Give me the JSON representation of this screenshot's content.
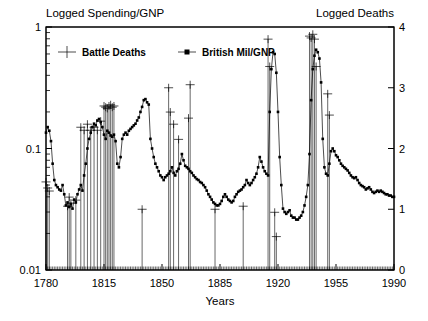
{
  "chart_data": {
    "type": "line",
    "title": "",
    "left_axis": {
      "label": "Logged Spending/GNP",
      "scale": "log",
      "ticks": [
        "1",
        "0.1",
        "0.01"
      ],
      "tickvals": [
        1,
        0.1,
        0.01
      ],
      "ylim": [
        0.01,
        1
      ]
    },
    "right_axis": {
      "label": "Logged Deaths",
      "scale": "linear",
      "ticks": [
        "4",
        "3",
        "2",
        "1",
        "0"
      ],
      "tickvals": [
        4,
        3,
        2,
        1,
        0
      ],
      "ylim": [
        0,
        4
      ]
    },
    "xlabel": "Years",
    "xticks": [
      "1780",
      "1815",
      "1850",
      "1885",
      "1920",
      "1955",
      "1990"
    ],
    "xtickvals": [
      1780,
      1815,
      1850,
      1885,
      1920,
      1955,
      1990
    ],
    "xlim": [
      1780,
      1990
    ],
    "grid": false,
    "legend_position": "top-left-inside",
    "series": [
      {
        "name": "Battle Deaths",
        "axis": "right",
        "marker": "plus",
        "style": "spikes",
        "points": [
          [
            1780,
            1.45
          ],
          [
            1781,
            1.35
          ],
          [
            1782,
            1.3
          ],
          [
            1793,
            1.05
          ],
          [
            1794,
            1.2
          ],
          [
            1795,
            1.1
          ],
          [
            1798,
            1.15
          ],
          [
            1801,
            2.35
          ],
          [
            1803,
            2.3
          ],
          [
            1805,
            2.4
          ],
          [
            1807,
            2.3
          ],
          [
            1809,
            2.35
          ],
          [
            1811,
            2.3
          ],
          [
            1813,
            2.45
          ],
          [
            1815,
            2.7
          ],
          [
            1816,
            2.68
          ],
          [
            1817,
            2.66
          ],
          [
            1818,
            2.7
          ],
          [
            1819,
            2.72
          ],
          [
            1820,
            2.68
          ],
          [
            1821,
            2.7
          ],
          [
            1838,
            1.0
          ],
          [
            1854,
            3.0
          ],
          [
            1855,
            2.6
          ],
          [
            1857,
            2.4
          ],
          [
            1860,
            2.15
          ],
          [
            1866,
            2.5
          ],
          [
            1867,
            3.05
          ],
          [
            1882,
            1.0
          ],
          [
            1899,
            1.05
          ],
          [
            1914,
            3.8
          ],
          [
            1915,
            3.35
          ],
          [
            1918,
            0.95
          ],
          [
            1919,
            0.55
          ],
          [
            1939,
            3.85
          ],
          [
            1940,
            3.82
          ],
          [
            1941,
            3.88
          ],
          [
            1942,
            3.8
          ],
          [
            1943,
            3.35
          ],
          [
            1950,
            2.9
          ],
          [
            1951,
            2.55
          ]
        ]
      },
      {
        "name": "British Mil/GNP",
        "axis": "left",
        "marker": "dot",
        "style": "continuous",
        "points": [
          [
            1780,
            0.135
          ],
          [
            1781,
            0.15
          ],
          [
            1782,
            0.14
          ],
          [
            1783,
            0.115
          ],
          [
            1784,
            0.075
          ],
          [
            1785,
            0.055
          ],
          [
            1786,
            0.05
          ],
          [
            1787,
            0.048
          ],
          [
            1788,
            0.046
          ],
          [
            1789,
            0.045
          ],
          [
            1790,
            0.05
          ],
          [
            1791,
            0.042
          ],
          [
            1792,
            0.034
          ],
          [
            1793,
            0.036
          ],
          [
            1794,
            0.033
          ],
          [
            1795,
            0.035
          ],
          [
            1796,
            0.032
          ],
          [
            1797,
            0.038
          ],
          [
            1798,
            0.036
          ],
          [
            1799,
            0.042
          ],
          [
            1800,
            0.046
          ],
          [
            1801,
            0.05
          ],
          [
            1802,
            0.045
          ],
          [
            1803,
            0.06
          ],
          [
            1804,
            0.075
          ],
          [
            1805,
            0.1
          ],
          [
            1806,
            0.12
          ],
          [
            1807,
            0.135
          ],
          [
            1808,
            0.15
          ],
          [
            1809,
            0.16
          ],
          [
            1810,
            0.155
          ],
          [
            1811,
            0.17
          ],
          [
            1812,
            0.175
          ],
          [
            1813,
            0.165
          ],
          [
            1814,
            0.15
          ],
          [
            1815,
            0.13
          ],
          [
            1816,
            0.12
          ],
          [
            1817,
            0.14
          ],
          [
            1818,
            0.135
          ],
          [
            1819,
            0.128
          ],
          [
            1820,
            0.125
          ],
          [
            1821,
            0.13
          ],
          [
            1822,
            0.115
          ],
          [
            1823,
            0.075
          ],
          [
            1824,
            0.07
          ],
          [
            1825,
            0.085
          ],
          [
            1826,
            0.12
          ],
          [
            1827,
            0.13
          ],
          [
            1828,
            0.135
          ],
          [
            1829,
            0.13
          ],
          [
            1830,
            0.14
          ],
          [
            1831,
            0.145
          ],
          [
            1832,
            0.15
          ],
          [
            1833,
            0.155
          ],
          [
            1834,
            0.16
          ],
          [
            1835,
            0.17
          ],
          [
            1836,
            0.18
          ],
          [
            1837,
            0.2
          ],
          [
            1838,
            0.22
          ],
          [
            1839,
            0.25
          ],
          [
            1840,
            0.255
          ],
          [
            1841,
            0.24
          ],
          [
            1842,
            0.23
          ],
          [
            1843,
            0.12
          ],
          [
            1844,
            0.1
          ],
          [
            1845,
            0.085
          ],
          [
            1846,
            0.075
          ],
          [
            1847,
            0.07
          ],
          [
            1848,
            0.065
          ],
          [
            1849,
            0.06
          ],
          [
            1850,
            0.058
          ],
          [
            1851,
            0.055
          ],
          [
            1852,
            0.058
          ],
          [
            1853,
            0.06
          ],
          [
            1854,
            0.062
          ],
          [
            1855,
            0.065
          ],
          [
            1856,
            0.07
          ],
          [
            1857,
            0.063
          ],
          [
            1858,
            0.06
          ],
          [
            1859,
            0.065
          ],
          [
            1860,
            0.068
          ],
          [
            1861,
            0.075
          ],
          [
            1862,
            0.09
          ],
          [
            1863,
            0.08
          ],
          [
            1864,
            0.072
          ],
          [
            1865,
            0.07
          ],
          [
            1866,
            0.068
          ],
          [
            1867,
            0.065
          ],
          [
            1868,
            0.063
          ],
          [
            1869,
            0.06
          ],
          [
            1870,
            0.058
          ],
          [
            1871,
            0.056
          ],
          [
            1872,
            0.055
          ],
          [
            1873,
            0.053
          ],
          [
            1874,
            0.052
          ],
          [
            1875,
            0.05
          ],
          [
            1876,
            0.048
          ],
          [
            1877,
            0.045
          ],
          [
            1878,
            0.042
          ],
          [
            1879,
            0.04
          ],
          [
            1880,
            0.038
          ],
          [
            1881,
            0.036
          ],
          [
            1882,
            0.035
          ],
          [
            1883,
            0.034
          ],
          [
            1884,
            0.034
          ],
          [
            1885,
            0.035
          ],
          [
            1886,
            0.037
          ],
          [
            1887,
            0.04
          ],
          [
            1888,
            0.042
          ],
          [
            1889,
            0.04
          ],
          [
            1890,
            0.038
          ],
          [
            1891,
            0.037
          ],
          [
            1892,
            0.036
          ],
          [
            1893,
            0.037
          ],
          [
            1894,
            0.04
          ],
          [
            1895,
            0.042
          ],
          [
            1896,
            0.044
          ],
          [
            1897,
            0.045
          ],
          [
            1898,
            0.046
          ],
          [
            1899,
            0.048
          ],
          [
            1900,
            0.05
          ],
          [
            1901,
            0.055
          ],
          [
            1902,
            0.052
          ],
          [
            1903,
            0.05
          ],
          [
            1904,
            0.052
          ],
          [
            1905,
            0.055
          ],
          [
            1906,
            0.058
          ],
          [
            1907,
            0.062
          ],
          [
            1908,
            0.07
          ],
          [
            1909,
            0.085
          ],
          [
            1910,
            0.078
          ],
          [
            1911,
            0.07
          ],
          [
            1912,
            0.065
          ],
          [
            1913,
            0.062
          ],
          [
            1914,
            0.06
          ],
          [
            1915,
            0.2
          ],
          [
            1916,
            0.45
          ],
          [
            1917,
            0.62
          ],
          [
            1918,
            0.6
          ],
          [
            1919,
            0.42
          ],
          [
            1920,
            0.2
          ],
          [
            1921,
            0.085
          ],
          [
            1922,
            0.05
          ],
          [
            1923,
            0.032
          ],
          [
            1924,
            0.03
          ],
          [
            1925,
            0.029
          ],
          [
            1926,
            0.03
          ],
          [
            1927,
            0.031
          ],
          [
            1928,
            0.028
          ],
          [
            1929,
            0.027
          ],
          [
            1930,
            0.027
          ],
          [
            1931,
            0.026
          ],
          [
            1932,
            0.026
          ],
          [
            1933,
            0.027
          ],
          [
            1934,
            0.028
          ],
          [
            1935,
            0.03
          ],
          [
            1936,
            0.034
          ],
          [
            1937,
            0.04
          ],
          [
            1938,
            0.05
          ],
          [
            1939,
            0.09
          ],
          [
            1940,
            0.25
          ],
          [
            1941,
            0.45
          ],
          [
            1942,
            0.58
          ],
          [
            1943,
            0.65
          ],
          [
            1944,
            0.62
          ],
          [
            1945,
            0.55
          ],
          [
            1946,
            0.35
          ],
          [
            1947,
            0.12
          ],
          [
            1948,
            0.07
          ],
          [
            1949,
            0.062
          ],
          [
            1950,
            0.06
          ],
          [
            1951,
            0.075
          ],
          [
            1952,
            0.095
          ],
          [
            1953,
            0.1
          ],
          [
            1954,
            0.095
          ],
          [
            1955,
            0.088
          ],
          [
            1956,
            0.085
          ],
          [
            1957,
            0.08
          ],
          [
            1958,
            0.075
          ],
          [
            1959,
            0.072
          ],
          [
            1960,
            0.07
          ],
          [
            1961,
            0.068
          ],
          [
            1962,
            0.066
          ],
          [
            1963,
            0.063
          ],
          [
            1964,
            0.06
          ],
          [
            1965,
            0.058
          ],
          [
            1966,
            0.057
          ],
          [
            1967,
            0.058
          ],
          [
            1968,
            0.055
          ],
          [
            1969,
            0.052
          ],
          [
            1970,
            0.05
          ],
          [
            1971,
            0.049
          ],
          [
            1972,
            0.048
          ],
          [
            1973,
            0.046
          ],
          [
            1974,
            0.047
          ],
          [
            1975,
            0.048
          ],
          [
            1976,
            0.046
          ],
          [
            1977,
            0.044
          ],
          [
            1978,
            0.043
          ],
          [
            1979,
            0.044
          ],
          [
            1980,
            0.045
          ],
          [
            1981,
            0.044
          ],
          [
            1982,
            0.045
          ],
          [
            1983,
            0.044
          ],
          [
            1984,
            0.043
          ],
          [
            1985,
            0.042
          ],
          [
            1986,
            0.042
          ],
          [
            1987,
            0.041
          ],
          [
            1988,
            0.041
          ],
          [
            1989,
            0.04
          ],
          [
            1990,
            0.04
          ]
        ]
      }
    ]
  },
  "legend": {
    "items": [
      {
        "label": "Battle Deaths",
        "marker": "plus"
      },
      {
        "label": "British Mil/GNP",
        "marker": "dot"
      }
    ]
  },
  "colors": {
    "axis": "#000000",
    "line": "#000000",
    "background": "#ffffff"
  }
}
